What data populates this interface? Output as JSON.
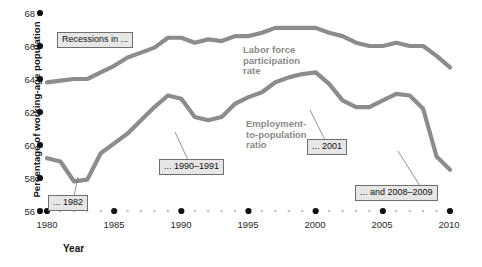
{
  "chart_data": {
    "type": "line",
    "title": "",
    "xlabel": "Year",
    "ylabel": "Percentage of working-age population",
    "xlim": [
      1980,
      2010
    ],
    "ylim": [
      56,
      68
    ],
    "grid": false,
    "legend_position": "inline-annotations",
    "ytick_labels": [
      "68",
      "66",
      "64",
      "62",
      "60",
      "58",
      "56"
    ],
    "ytick_values": [
      68,
      66,
      64,
      62,
      60,
      58,
      56
    ],
    "xtick_labels": [
      "1980",
      "1985",
      "1990",
      "1995",
      "2000",
      "2005",
      "2010"
    ],
    "xtick_values": [
      1980,
      1985,
      1990,
      1995,
      2000,
      2005,
      2010
    ],
    "x": [
      1980,
      1981,
      1982,
      1983,
      1984,
      1985,
      1986,
      1987,
      1988,
      1989,
      1990,
      1991,
      1992,
      1993,
      1994,
      1995,
      1996,
      1997,
      1998,
      1999,
      2000,
      2001,
      2002,
      2003,
      2004,
      2005,
      2006,
      2007,
      2008,
      2009,
      2010
    ],
    "series": [
      {
        "name": "Labor force participation rate",
        "color": "#8c8c8c",
        "values": [
          63.8,
          63.9,
          64.0,
          64.0,
          64.4,
          64.8,
          65.3,
          65.6,
          65.9,
          66.5,
          66.5,
          66.2,
          66.4,
          66.3,
          66.6,
          66.6,
          66.8,
          67.1,
          67.1,
          67.1,
          67.1,
          66.8,
          66.6,
          66.2,
          66.0,
          66.0,
          66.2,
          66.0,
          66.0,
          65.4,
          64.7
        ]
      },
      {
        "name": "Employment-to-population ratio",
        "color": "#8c8c8c",
        "values": [
          59.2,
          59.0,
          57.8,
          57.9,
          59.5,
          60.1,
          60.7,
          61.5,
          62.3,
          63.0,
          62.8,
          61.7,
          61.5,
          61.7,
          62.5,
          62.9,
          63.2,
          63.8,
          64.1,
          64.3,
          64.4,
          63.7,
          62.7,
          62.3,
          62.3,
          62.7,
          63.1,
          63.0,
          62.2,
          59.3,
          58.5
        ]
      }
    ],
    "annotations": [
      {
        "label": "Recessions in ...",
        "type": "callout"
      },
      {
        "label": "... 1982",
        "type": "callout"
      },
      {
        "label": "... 1990–1991",
        "type": "callout"
      },
      {
        "label": "... 2001",
        "type": "callout"
      },
      {
        "label": "... and 2008–2009",
        "type": "callout"
      }
    ],
    "series_labels": [
      {
        "text": "Labor force\nparticipation\nrate"
      },
      {
        "text": "Employment-\nto-population\nratio"
      }
    ]
  },
  "axis": {
    "ylabel": "Percentage of working-age population",
    "xlabel": "Year",
    "yticks": [
      "68",
      "66",
      "64",
      "62",
      "60",
      "58",
      "56"
    ],
    "xticks": [
      "1980",
      "1985",
      "1990",
      "1995",
      "2000",
      "2005",
      "2010"
    ]
  },
  "callouts": {
    "recessions": "Recessions in ...",
    "y1982": "... 1982",
    "y1990": "... 1990–1991",
    "y2001": "... 2001",
    "y2008": "... and 2008–2009"
  },
  "series_text": {
    "lfp": "Labor force\nparticipation\nrate",
    "epop": "Employment-\nto-population\nratio"
  },
  "colors": {
    "line": "#8c8c8c",
    "callout_bg": "#e6e6e6",
    "callout_border": "#6f6f6f",
    "dot": "#111111",
    "minor_dot": "#bdbdbd",
    "series_label": "#8a8a8a"
  }
}
